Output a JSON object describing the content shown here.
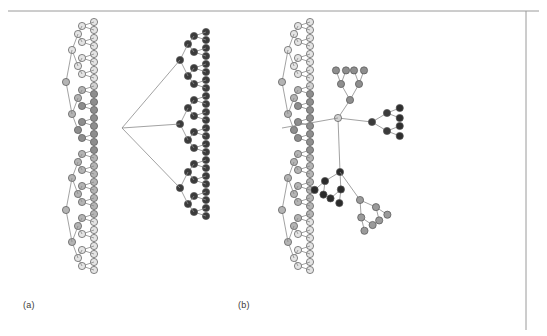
{
  "figure": {
    "type": "diagram",
    "background_color": "#ffffff",
    "border_color": "#9a9a9a",
    "edge_color": "#8a8a8a",
    "node_stroke": "#555555",
    "panels": [
      {
        "id": "a",
        "label": "(a)",
        "label_x": 23,
        "label_y": 300
      },
      {
        "id": "b",
        "label": "(b)",
        "label_x": 238,
        "label_y": 300
      }
    ],
    "frame": {
      "top_line": {
        "x1": 8,
        "y1": 11,
        "x2": 539,
        "y2": 11
      },
      "right_line": {
        "x1": 526,
        "y1": 11,
        "x2": 526,
        "y2": 330
      }
    },
    "node_colors": {
      "lightest": "#e4e4e4",
      "light": "#d2d2d2",
      "mid_light": "#b4b4b4",
      "mid": "#8e8e8e",
      "mid_dark": "#6e6e6e",
      "dark": "#555555",
      "darkest": "#2b2b2b"
    },
    "node_radius": 3.6,
    "leaf_spacing": 8.0
  },
  "chart_data": {
    "type": "diagram",
    "title": "",
    "panel_a": {
      "layout": "left-to-right dendrogram with vertical leaf column plus mirrored right subtree",
      "leaf_column_x": 94,
      "leaf_top_y": 22,
      "leaf_count": 32,
      "leaf_shades": [
        "#e4e4e4",
        "#e4e4e4",
        "#e4e4e4",
        "#e4e4e4",
        "#e4e4e4",
        "#e4e4e4",
        "#e4e4e4",
        "#e4e4e4",
        "#d2d2d2",
        "#8e8e8e",
        "#8e8e8e",
        "#8e8e8e",
        "#8e8e8e",
        "#8e8e8e",
        "#8e8e8e",
        "#8e8e8e",
        "#8e8e8e",
        "#b4b4b4",
        "#b4b4b4",
        "#b4b4b4",
        "#b4b4b4",
        "#b4b4b4",
        "#b4b4b4",
        "#b4b4b4",
        "#b4b4b4",
        "#e4e4e4",
        "#e4e4e4",
        "#e4e4e4",
        "#e4e4e4",
        "#e4e4e4",
        "#e4e4e4",
        "#e4e4e4"
      ],
      "right_leaf_column_x": 206,
      "right_leaf_count": 24,
      "right_leaf_shade": "#3b3b3b",
      "groups": [
        {
          "name": "cluster-1",
          "shade": "#e4e4e4",
          "size": 8
        },
        {
          "name": "cluster-2",
          "shade": "#8e8e8e",
          "size": 9
        },
        {
          "name": "cluster-3",
          "shade": "#b4b4b4",
          "size": 8
        },
        {
          "name": "cluster-4",
          "shade": "#e4e4e4",
          "size": 7
        },
        {
          "name": "cluster-dark",
          "shade": "#3b3b3b",
          "size": 24
        }
      ]
    },
    "panel_b": {
      "layout": "same left dendrogram, right portion re-drawn as free radial clusters",
      "leaf_column_x": 310,
      "leaf_top_y": 22,
      "leaf_count": 32,
      "clusters": [
        {
          "name": "upper-grey-fan",
          "shade": "#8e8e8e",
          "size": 7
        },
        {
          "name": "right-dark-fan",
          "shade": "#3b3b3b",
          "size": 7
        },
        {
          "name": "lower-dark-fan",
          "shade": "#2b2b2b",
          "size": 7
        },
        {
          "name": "lower-grey-fan",
          "shade": "#9a9a9a",
          "size": 8
        }
      ]
    }
  }
}
